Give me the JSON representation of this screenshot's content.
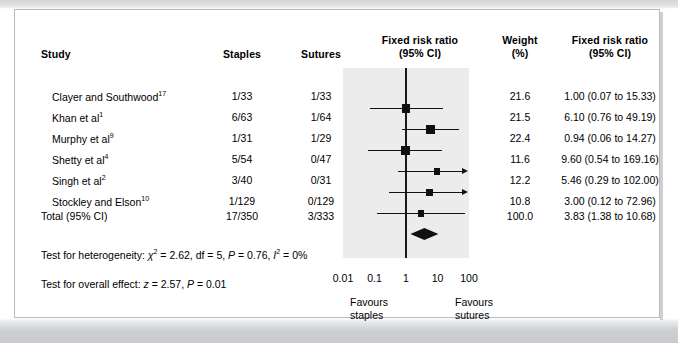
{
  "headers": {
    "study": "Study",
    "staples": "Staples",
    "sutures": "Sutures",
    "plot_title_l1": "Fixed risk ratio",
    "plot_title_l2": "(95% CI)",
    "weight_l1": "Weight",
    "weight_l2": "(%)",
    "fixed_l1": "Fixed risk ratio",
    "fixed_l2": "(95% CI)"
  },
  "rows": [
    {
      "study": "Clayer and Southwood",
      "ref": "17",
      "staples": "1/33",
      "sutures": "1/33",
      "weight": "21.6",
      "rr": "1.00 (0.07 to 15.33)"
    },
    {
      "study": "Khan et al",
      "ref": "1",
      "staples": "6/63",
      "sutures": "1/64",
      "weight": "21.5",
      "rr": "6.10 (0.76 to 49.19)"
    },
    {
      "study": "Murphy et al",
      "ref": "9",
      "staples": "1/31",
      "sutures": "1/29",
      "weight": "22.4",
      "rr": "0.94 (0.06 to 14.27)"
    },
    {
      "study": "Shetty et al",
      "ref": "4",
      "staples": "5/54",
      "sutures": "0/47",
      "weight": "11.6",
      "rr": "9.60 (0.54 to 169.16)"
    },
    {
      "study": "Singh et al",
      "ref": "2",
      "staples": "3/40",
      "sutures": "0/31",
      "weight": "12.2",
      "rr": "5.46 (0.29 to 102.00)"
    },
    {
      "study": "Stockley and Elson",
      "ref": "10",
      "staples": "1/129",
      "sutures": "0/129",
      "weight": "10.8",
      "rr": "3.00 (0.12 to 72.96)"
    }
  ],
  "total": {
    "study": "Total (95% CI)",
    "staples": "17/350",
    "sutures": "3/333",
    "weight": "100.0",
    "rr": "3.83 (1.38 to 10.68)"
  },
  "stats": {
    "heterogeneity": "Test for heterogeneity: χ² = 2.62, df = 5, P = 0.76, I² = 0%",
    "overall": "Test for overall effect: z = 2.57, P = 0.01"
  },
  "axis": {
    "ticks": [
      "0.01",
      "0.1",
      "1",
      "10",
      "100"
    ],
    "favours_left_l1": "Favours",
    "favours_left_l2": "staples",
    "favours_right_l1": "Favours",
    "favours_right_l2": "sutures"
  },
  "colors": {
    "marker": "#111111",
    "band": "#ececec",
    "page": "#d7d8da",
    "card": "#ffffff"
  },
  "chart_data": {
    "type": "forest",
    "title": "Fixed risk ratio (95% CI)",
    "xlabel": "Risk ratio (log scale)",
    "ylabel": "",
    "xscale": "log",
    "xlim": [
      0.01,
      100
    ],
    "xticks": [
      0.01,
      0.1,
      1,
      10,
      100
    ],
    "null_line": 1,
    "grid": false,
    "legend": "none",
    "categories": [
      "Clayer and Southwood",
      "Khan et al",
      "Murphy et al",
      "Shetty et al",
      "Singh et al",
      "Stockley and Elson",
      "Total (95% CI)"
    ],
    "effect": [
      1.0,
      6.1,
      0.94,
      9.6,
      5.46,
      3.0,
      3.83
    ],
    "ci_low": [
      0.07,
      0.76,
      0.06,
      0.54,
      0.29,
      0.12,
      1.38
    ],
    "ci_high": [
      15.33,
      49.19,
      14.27,
      169.16,
      102.0,
      72.96,
      10.68
    ],
    "weights": [
      21.6,
      21.5,
      22.4,
      11.6,
      12.2,
      10.8,
      100.0
    ],
    "events_treatment": [
      "1/33",
      "6/63",
      "1/31",
      "5/54",
      "3/40",
      "1/129",
      "17/350"
    ],
    "events_control": [
      "1/33",
      "1/64",
      "1/29",
      "0/47",
      "0/31",
      "0/129",
      "3/333"
    ],
    "arrow_right": [
      false,
      false,
      false,
      true,
      true,
      false,
      false
    ],
    "annotations": [
      "Test for heterogeneity: chi2 = 2.62, df = 5, P = 0.76, I2 = 0%",
      "Test for overall effect: z = 2.57, P = 0.01",
      "Favours staples",
      "Favours sutures"
    ]
  }
}
